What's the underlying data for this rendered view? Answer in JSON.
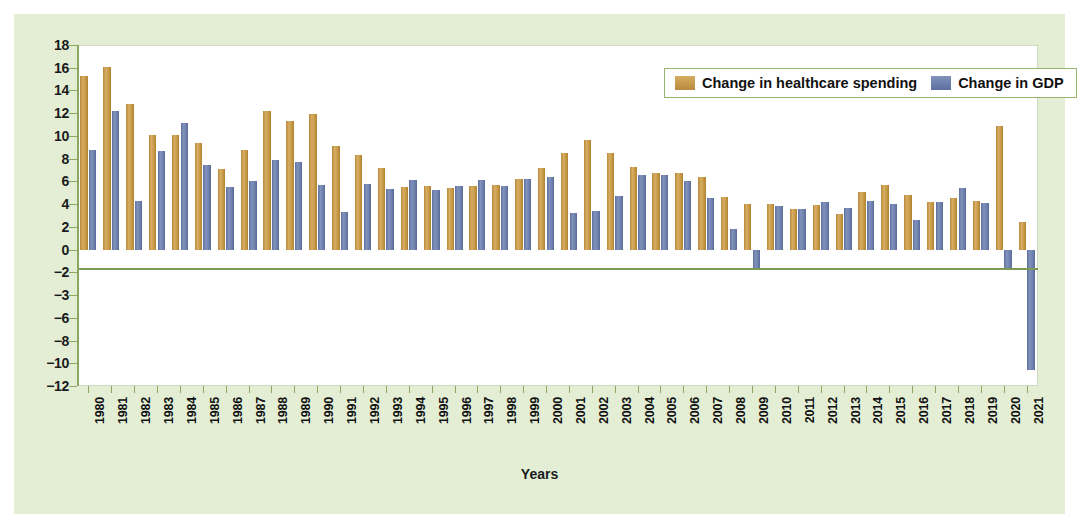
{
  "figure": {
    "background": "#e3eed5",
    "plot_background": "#ffffff"
  },
  "legend": {
    "position": "top-right",
    "entries": [
      {
        "label": "Change in healthcare spending",
        "color": "#c79a48"
      },
      {
        "label": "Change in GDP",
        "color": "#6f81ad"
      }
    ]
  },
  "chart_data": {
    "type": "bar",
    "title": "",
    "xlabel": "Years",
    "ylabel": "",
    "ylim": [
      -12,
      18
    ],
    "grid": false,
    "legend_position": "top-right",
    "ytick_labels": [
      "18",
      "16",
      "14",
      "12",
      "10",
      "8",
      "6",
      "4",
      "2",
      "0",
      "−2",
      "−3",
      "−6",
      "−8",
      "−10",
      "−12"
    ],
    "ytick_values": [
      18,
      16,
      14,
      12,
      10,
      8,
      6,
      4,
      2,
      0,
      -2,
      -4,
      -6,
      -8,
      -10,
      -12
    ],
    "categories": [
      "1980",
      "1981",
      "1982",
      "1983",
      "1984",
      "1985",
      "1986",
      "1987",
      "1988",
      "1989",
      "1990",
      "1991",
      "1992",
      "1993",
      "1994",
      "1995",
      "1996",
      "1997",
      "1998",
      "1999",
      "2000",
      "2001",
      "2002",
      "2003",
      "2004",
      "2005",
      "2006",
      "2007",
      "2008",
      "2009",
      "2010",
      "2011",
      "2012",
      "2013",
      "2014",
      "2015",
      "2016",
      "2017",
      "2018",
      "2019",
      "2020",
      "2021"
    ],
    "series": [
      {
        "name": "Change in healthcare spending",
        "color": "#c79a48",
        "values": [
          15.3,
          16.1,
          12.8,
          10.1,
          10.1,
          9.4,
          7.1,
          8.8,
          12.2,
          11.3,
          11.9,
          9.1,
          8.3,
          7.2,
          5.5,
          5.6,
          5.4,
          5.6,
          5.7,
          6.2,
          7.2,
          8.5,
          9.6,
          8.5,
          7.3,
          6.7,
          6.7,
          6.4,
          4.6,
          4.0,
          4.0,
          3.6,
          3.9,
          3.1,
          5.1,
          5.7,
          4.8,
          4.2,
          4.5,
          4.3,
          10.9,
          2.4
        ]
      },
      {
        "name": "Change in GDP",
        "color": "#6f81ad",
        "values": [
          8.8,
          12.2,
          4.3,
          8.7,
          11.1,
          7.4,
          5.5,
          6.0,
          7.9,
          7.7,
          5.7,
          3.3,
          5.8,
          5.3,
          6.1,
          5.2,
          5.6,
          6.1,
          5.6,
          6.2,
          6.4,
          3.2,
          3.4,
          4.7,
          6.6,
          6.6,
          6.0,
          4.5,
          1.8,
          -1.6,
          3.8,
          3.6,
          4.2,
          3.7,
          4.3,
          4.0,
          2.6,
          4.2,
          5.4,
          4.1,
          -1.6,
          -10.6
        ]
      }
    ]
  }
}
